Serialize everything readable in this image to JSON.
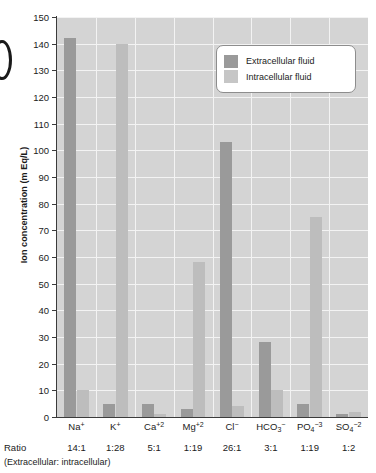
{
  "chart_data": {
    "type": "bar",
    "title": "",
    "xlabel": "",
    "ylabel": "Ion concentration (m Eq/L)",
    "ylim": [
      0,
      150
    ],
    "ytick_step": 10,
    "yticks": [
      0,
      10,
      20,
      30,
      40,
      50,
      60,
      70,
      80,
      90,
      100,
      110,
      120,
      130,
      140,
      150
    ],
    "grid": true,
    "legend_position": "top-right",
    "categories": [
      "Na+",
      "K+",
      "Ca+2",
      "Mg+2",
      "Cl-",
      "HCO3-",
      "PO4-3",
      "SO4-2"
    ],
    "series": [
      {
        "name": "Extracellular fluid",
        "color": "#9a9a9a",
        "values": [
          142,
          5,
          5,
          3,
          103,
          28,
          5,
          1
        ]
      },
      {
        "name": "Intracellular fluid",
        "color": "#bdbdbd",
        "values": [
          10,
          140,
          1,
          58,
          4,
          10,
          75,
          2
        ]
      }
    ],
    "ratios": [
      "14:1",
      "1:28",
      "5:1",
      "1:19",
      "26:1",
      "3:1",
      "1:19",
      "1:2"
    ],
    "ratio_row_label": "Ratio",
    "ratio_note": "(Extracellular: intracellular)"
  },
  "labels": {
    "categories_html": [
      "Na<sup>+</sup>",
      "K<sup>+</sup>",
      "Ca<sup>+2</sup>",
      "Mg<sup>+2</sup>",
      "Cl<sup>−</sup>",
      "HCO<sub>3</sub><sup>−</sup>",
      "PO<sub>4</sub><sup>−3</sup>",
      "SO<sub>4</sub><sup>−2</sup>"
    ]
  },
  "legend": {
    "items": [
      {
        "label": "Extracellular fluid",
        "swatch": "ecf"
      },
      {
        "label": "Intracellular fluid",
        "swatch": "icf"
      }
    ]
  }
}
